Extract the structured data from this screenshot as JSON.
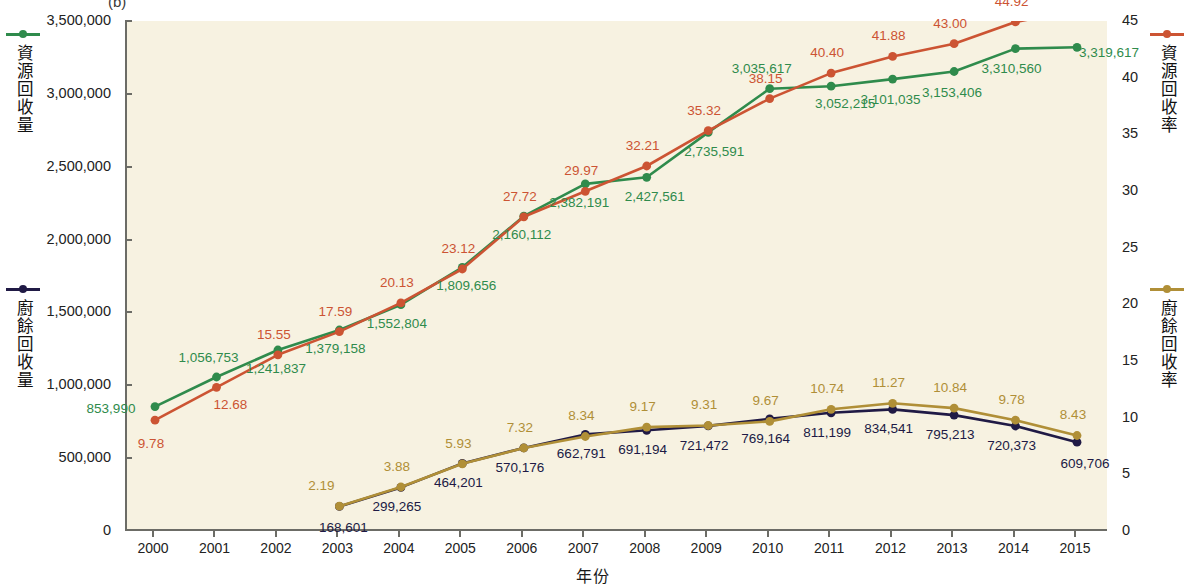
{
  "panel": {
    "label": "(b)"
  },
  "axes": {
    "x_title": "年份",
    "x_ticks": [
      "2000",
      "2001",
      "2002",
      "2003",
      "2004",
      "2005",
      "2006",
      "2007",
      "2008",
      "2009",
      "2010",
      "2011",
      "2012",
      "2013",
      "2014",
      "2015"
    ],
    "left_ticks": [
      "3,500,000",
      "3,000,000",
      "2,500,000",
      "2,000,000",
      "1,500,000",
      "1,000,000",
      "500,000",
      "0"
    ],
    "right_ticks": [
      "45",
      "40",
      "35",
      "30",
      "25",
      "20",
      "15",
      "10",
      "5",
      "0"
    ]
  },
  "legends": {
    "left_top": {
      "label": "資源回收量",
      "color": "#2f8b4c"
    },
    "left_bottom": {
      "label": "廚餘回收量",
      "color": "#201a45"
    },
    "right_top": {
      "label": "資源回收率",
      "color": "#cc5433"
    },
    "right_bottom": {
      "label": "廚餘回收率",
      "color": "#b08f37"
    }
  },
  "chart_data": {
    "type": "line",
    "title": "(b)",
    "xlabel": "年份",
    "ylabel": "資源回收量 / 廚餘回收量",
    "y2label": "資源回收率 / 廚餘回收率",
    "grid": false,
    "legend_position": "outside-left-and-right",
    "x": [
      2000,
      2001,
      2002,
      2003,
      2004,
      2005,
      2006,
      2007,
      2008,
      2009,
      2010,
      2011,
      2012,
      2013,
      2014,
      2015
    ],
    "ylim": [
      0,
      3500000
    ],
    "y2lim": [
      0,
      45
    ],
    "series": [
      {
        "name": "資源回收量",
        "axis": "left",
        "color": "#2f8b4c",
        "unit": "公噸",
        "values": [
          853990,
          1056753,
          1241837,
          1379158,
          1552804,
          1809656,
          2160112,
          2382191,
          2427561,
          2735591,
          3035617,
          3052215,
          3101035,
          3153406,
          3310560,
          3319617
        ],
        "labels": [
          "853,990",
          "1,056,753",
          "1,241,837",
          "1,379,158",
          "1,552,804",
          "1,809,656",
          "2,160,112",
          "2,382,191",
          "2,427,561",
          "2,735,591",
          "3,035,617",
          "3,052,215",
          "3,101,035",
          "3,153,406",
          "3,310,560",
          "3,319,617"
        ]
      },
      {
        "name": "資源回收率",
        "axis": "right",
        "color": "#cc5433",
        "unit": "%",
        "values": [
          9.78,
          12.68,
          15.55,
          17.59,
          20.13,
          23.12,
          27.72,
          29.97,
          32.21,
          35.32,
          38.15,
          40.4,
          41.88,
          43.0,
          44.92,
          45.92
        ],
        "labels": [
          "9.78",
          "12.68",
          "15.55",
          "17.59",
          "20.13",
          "23.12",
          "27.72",
          "29.97",
          "32.21",
          "35.32",
          "38.15",
          "40.40",
          "41.88",
          "43.00",
          "44.92",
          "45.92"
        ]
      },
      {
        "name": "廚餘回收量",
        "axis": "left",
        "color": "#201a45",
        "unit": "公噸",
        "values": [
          null,
          null,
          null,
          168601,
          299265,
          464201,
          570176,
          662791,
          691194,
          721472,
          769164,
          811199,
          834541,
          795213,
          720373,
          609706
        ],
        "labels": [
          null,
          null,
          null,
          "168,601",
          "299,265",
          "464,201",
          "570,176",
          "662,791",
          "691,194",
          "721,472",
          "769,164",
          "811,199",
          "834,541",
          "795,213",
          "720,373",
          "609,706"
        ]
      },
      {
        "name": "廚餘回收率",
        "axis": "right",
        "color": "#b08f37",
        "unit": "%",
        "values": [
          null,
          null,
          null,
          2.19,
          3.88,
          5.93,
          7.32,
          8.34,
          9.17,
          9.31,
          9.67,
          10.74,
          11.27,
          10.84,
          9.78,
          8.43
        ],
        "labels": [
          null,
          null,
          null,
          "2.19",
          "3.88",
          "5.93",
          "7.32",
          "8.34",
          "9.17",
          "9.31",
          "9.67",
          "10.74",
          "11.27",
          "10.84",
          "9.78",
          "8.43"
        ]
      }
    ]
  }
}
